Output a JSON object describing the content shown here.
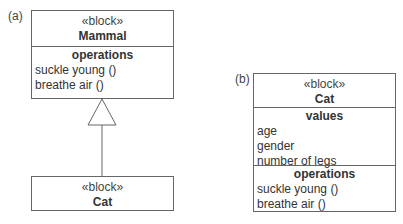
{
  "panel_a": {
    "label": "(a)",
    "parent_block": {
      "stereotype": "«block»",
      "name": "Mammal",
      "operations": {
        "title": "operations",
        "items": [
          "suckle young ()",
          "breathe air ()"
        ]
      }
    },
    "relationship": "generalization",
    "child_block": {
      "stereotype": "«block»",
      "name": "Cat"
    }
  },
  "panel_b": {
    "label": "(b)",
    "block": {
      "stereotype": "«block»",
      "name": "Cat",
      "values": {
        "title": "values",
        "items": [
          "age",
          "gender",
          "number of legs"
        ]
      },
      "operations": {
        "title": "operations",
        "items": [
          "suckle young ()",
          "breathe air ()"
        ]
      }
    }
  }
}
